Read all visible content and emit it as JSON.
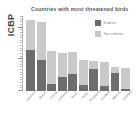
{
  "figure": {
    "source_label": "ICBP",
    "title": "Countries with most threatened birds"
  },
  "legend": {
    "position": "top-right",
    "items": [
      {
        "label": "Endemic",
        "color": "#6d6d6d",
        "swatch_name": "endemic"
      },
      {
        "label": "Non-endemic",
        "color": "#c9c9c9",
        "swatch_name": "nonendemic"
      }
    ]
  },
  "chart_data": {
    "type": "bar",
    "subtype": "stacked",
    "title": "Countries with most threatened birds",
    "xlabel": "",
    "ylabel": "ICBP",
    "grid": false,
    "legend_position": "top-right",
    "ylim": [
      0,
      140
    ],
    "yticks": [
      0,
      20,
      40,
      60,
      80,
      100,
      120,
      140
    ],
    "categories": [
      "Indonesia",
      "Brazil",
      "China",
      "Colombia",
      "Peru",
      "India",
      "Philippines",
      "Ecuador",
      "Mexico",
      "Vietnam"
    ],
    "series": [
      {
        "name": "Endemic",
        "color": "#6d6d6d",
        "values": [
          78,
          58,
          13,
          27,
          32,
          11,
          42,
          9,
          34,
          4
        ]
      },
      {
        "name": "Non-endemic",
        "color": "#c9c9c9",
        "values": [
          57,
          72,
          62,
          44,
          42,
          48,
          14,
          45,
          11,
          39
        ]
      }
    ],
    "totals": [
      135,
      130,
      75,
      71,
      74,
      59,
      56,
      54,
      45,
      43
    ]
  }
}
